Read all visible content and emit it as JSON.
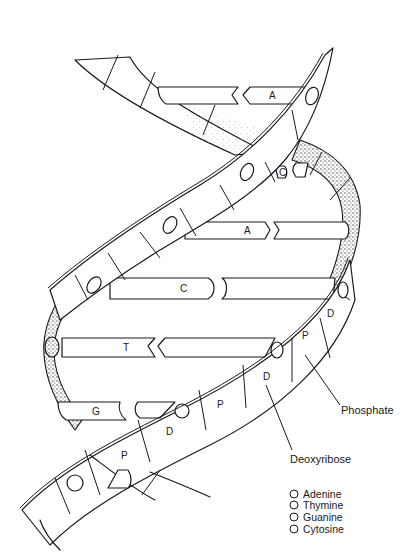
{
  "diagram": {
    "strand_labels": {
      "phosphate_short": "P",
      "deoxyribose_short": "D"
    },
    "base_pairs": [
      {
        "label": "A",
        "position": "top"
      },
      {
        "label": "C",
        "position": "upper-right"
      },
      {
        "label": "A",
        "position": "middle-upper"
      },
      {
        "label": "C",
        "position": "middle"
      },
      {
        "label": "T",
        "position": "middle-lower"
      },
      {
        "label": "G",
        "position": "bottom"
      }
    ],
    "backbone_labels": [
      "P",
      "D",
      "P",
      "D",
      "P",
      "D"
    ],
    "callouts": {
      "phosphate": "Phosphate",
      "deoxyribose": "Deoxyribose"
    }
  },
  "legend": {
    "items": [
      {
        "label": "Adenine"
      },
      {
        "label": "Thymine"
      },
      {
        "label": "Guanine"
      },
      {
        "label": "Cytosine"
      }
    ]
  },
  "colors": {
    "ink": "#1a1a1a",
    "background": "#ffffff"
  }
}
